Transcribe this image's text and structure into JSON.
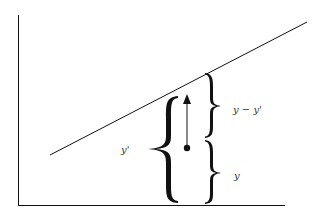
{
  "diagram": {
    "type": "regression-residual-illustration",
    "labels": {
      "predicted": "y'",
      "residual": "y − y'",
      "observed": "y"
    },
    "colors": {
      "ink": "#111111",
      "label": "#333333",
      "background": "#ffffff"
    },
    "elements": {
      "axes": "L-shaped axes (vertical y-axis, horizontal x-axis)",
      "regression_line": "straight line rising left to right",
      "data_point": "filled dot below the line",
      "arrow": "vertical arrow from data point up toward the line",
      "braces": [
        "large left brace spanning 0 to y'",
        "right upper brace spanning y to y'",
        "right lower brace spanning 0 to y"
      ]
    }
  }
}
